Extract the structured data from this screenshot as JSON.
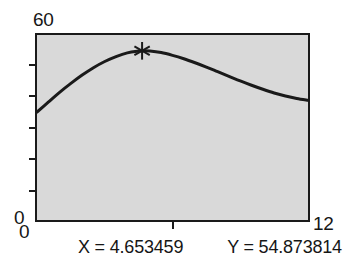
{
  "app": {
    "name": "function-plot-viewer"
  },
  "axes": {
    "y_max_label": "60",
    "y_min_label": "0",
    "x_min_label": "0",
    "x_max_label": "12",
    "y_ticks": [
      10,
      20,
      30,
      40,
      50
    ],
    "x_ticks": [
      6
    ]
  },
  "readout": {
    "x_text": "X = 4.653459",
    "y_text": "Y = 54.873814"
  },
  "colors": {
    "plot_background": "#d9d9d9",
    "page_background": "#ffffff",
    "frame": "#1a1a1a",
    "curve": "#1a1a1a",
    "text": "#161616",
    "marker": "#1a1a1a"
  },
  "chart_data": {
    "type": "line",
    "title": "",
    "xlabel": "",
    "ylabel": "",
    "xlim": [
      0,
      12
    ],
    "ylim": [
      0,
      60
    ],
    "grid": false,
    "legend": null,
    "x_tick_labels": [
      "0",
      "12"
    ],
    "y_tick_labels": [
      "0",
      "60"
    ],
    "series": [
      {
        "name": "curve",
        "x": [
          0,
          0.5,
          1,
          1.5,
          2,
          2.5,
          3,
          3.5,
          4,
          4.5,
          4.653459,
          5,
          5.5,
          6,
          6.5,
          7,
          7.5,
          8,
          8.5,
          9,
          9.5,
          10,
          10.5,
          11,
          11.5,
          12
        ],
        "y": [
          35.0,
          38.2,
          41.4,
          44.3,
          47.0,
          49.4,
          51.4,
          53.0,
          54.2,
          54.8,
          54.873814,
          54.8,
          54.3,
          53.4,
          52.3,
          51.0,
          49.6,
          48.1,
          46.6,
          45.1,
          43.7,
          42.4,
          41.2,
          40.2,
          39.4,
          38.8
        ]
      }
    ],
    "markers": [
      {
        "name": "cursor-marker",
        "shape": "asterisk",
        "x": 4.653459,
        "y": 54.873814
      }
    ],
    "annotations": [
      {
        "name": "x-readout",
        "text": "X = 4.653459"
      },
      {
        "name": "y-readout",
        "text": "Y = 54.873814"
      }
    ]
  }
}
